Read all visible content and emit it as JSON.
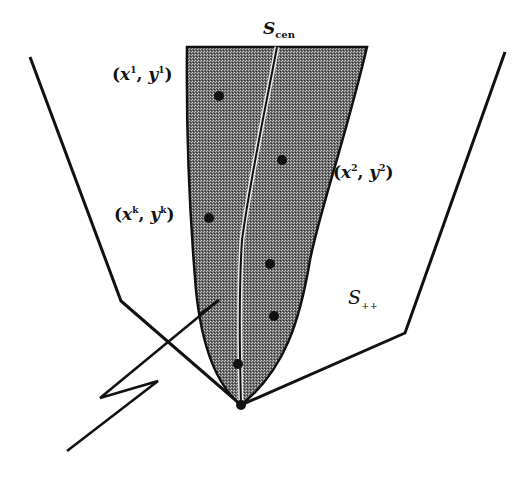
{
  "diagram": {
    "type": "cone-region-illustration",
    "labels": {
      "central_path": {
        "base": "S",
        "subscript": "cen"
      },
      "positive_cone": {
        "base": "S",
        "subscript": "++"
      },
      "point_1": {
        "open": "(",
        "x": "x",
        "sup1": "1",
        "sep": ", ",
        "y": "y",
        "sup2": "1",
        "close": ")"
      },
      "point_2": {
        "open": "(",
        "x": "x",
        "sup1": "2",
        "sep": ", ",
        "y": "y",
        "sup2": "2",
        "close": ")"
      },
      "point_k": {
        "open": "(",
        "x": "x",
        "sup1": "k",
        "sep": ", ",
        "y": "y",
        "sup2": "k",
        "close": ")"
      }
    },
    "colors": {
      "stroke": "#111111",
      "shade_dark": "#3a3a3a",
      "shade_light": "#8a8a8a",
      "background": "#ffffff"
    },
    "apex": [
      241,
      405
    ],
    "iterate_points": [
      [
        219,
        96
      ],
      [
        282,
        160
      ],
      [
        209,
        218
      ],
      [
        270,
        264
      ],
      [
        274,
        316
      ],
      [
        238,
        364
      ]
    ]
  }
}
